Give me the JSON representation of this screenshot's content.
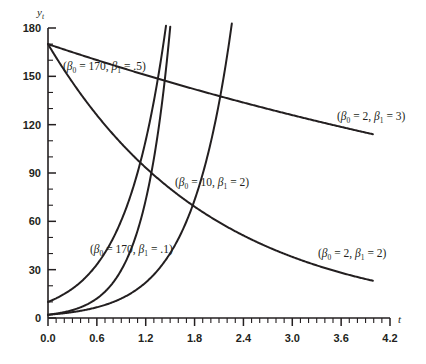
{
  "chart_data": {
    "type": "line",
    "title": "",
    "xlabel": "t",
    "ylabel": "y_t",
    "xlim": [
      0.0,
      4.2
    ],
    "ylim": [
      0,
      180
    ],
    "grid": false,
    "legend_position": "inline-annotations",
    "x_ticks": [
      "0.0",
      "0.6",
      "1.2",
      "1.8",
      "2.4",
      "3.0",
      "3.6",
      "4.2"
    ],
    "x_tick_values": [
      0.0,
      0.6,
      1.2,
      1.8,
      2.4,
      3.0,
      3.6,
      4.2
    ],
    "x_minor_step": 0.1,
    "y_ticks": [
      "0",
      "30",
      "60",
      "90",
      "120",
      "150",
      "180"
    ],
    "y_tick_values": [
      0,
      30,
      60,
      90,
      120,
      150,
      180
    ],
    "y_minor_step": 10,
    "model": "y_t = beta0 * exp(beta1 * t)",
    "series": [
      {
        "name": "(β₀ = 170, β₁ = .5)",
        "beta0": 170,
        "beta1": 0.5,
        "direction": "decay",
        "x": [
          0.0,
          0.2,
          0.4,
          0.6,
          0.8,
          1.0,
          1.2,
          1.4,
          1.6,
          1.8,
          2.0,
          2.2,
          2.4,
          2.6,
          2.8,
          3.0,
          3.2,
          3.4,
          3.6,
          3.8,
          4.0
        ],
        "values": [
          170.0,
          153.8,
          139.2,
          125.9,
          113.9,
          103.1,
          93.3,
          84.4,
          76.4,
          69.1,
          62.5,
          56.6,
          51.2,
          46.3,
          41.9,
          37.9,
          34.3,
          31.0,
          28.1,
          25.4,
          23.0
        ]
      },
      {
        "name": "(β₀ = 170, β₁ = .1)",
        "beta0": 170,
        "beta1": 0.1,
        "direction": "decay",
        "x": [
          0.0,
          0.1,
          0.2,
          0.3,
          0.4,
          0.5,
          0.6,
          0.7,
          0.8,
          0.9,
          1.0,
          1.2,
          1.4,
          1.6,
          1.8,
          2.0,
          2.4,
          2.8,
          3.2,
          3.6,
          4.0
        ],
        "values": [
          170.0,
          139.2,
          114.0,
          93.4,
          76.5,
          62.6,
          51.3,
          42.0,
          34.4,
          28.2,
          23.1,
          15.5,
          10.4,
          6.9,
          4.6,
          3.1,
          1.4,
          0.6,
          0.3,
          0.1,
          0.05
        ]
      },
      {
        "name": "(β₀ = 10, β₁ = 2)",
        "beta0": 10,
        "beta1": 2,
        "direction": "growth",
        "x": [
          0.0,
          0.2,
          0.4,
          0.6,
          0.8,
          1.0,
          1.2,
          1.4,
          1.6,
          1.8,
          2.0,
          2.2,
          2.4,
          2.6,
          2.8,
          3.0,
          3.2,
          3.4,
          3.6,
          3.8,
          4.0
        ],
        "values": [
          10.0,
          12.5,
          15.5,
          19.3,
          24.0,
          29.8,
          37.1,
          46.1,
          57.3,
          71.2,
          88.5,
          110.0,
          136.7,
          169.9,
          211.2,
          262.4,
          326.2,
          405.4,
          503.9,
          626.3,
          778.3
        ]
      },
      {
        "name": "(β₀ = 2, β₁ = 3)",
        "beta0": 2,
        "beta1": 3,
        "direction": "growth",
        "x": [
          0.0,
          0.2,
          0.4,
          0.6,
          0.8,
          1.0,
          1.2,
          1.4,
          1.6,
          1.8,
          2.0,
          2.2,
          2.4,
          2.6,
          2.8,
          3.0,
          3.2,
          3.4,
          3.6,
          3.8,
          4.0
        ],
        "values": [
          2.0,
          2.6,
          3.5,
          4.6,
          6.1,
          8.1,
          10.7,
          14.2,
          18.9,
          25.0,
          33.2,
          44.0,
          58.4,
          77.5,
          102.8,
          136.3,
          180.8,
          239.8,
          318.1,
          421.9,
          559.6
        ]
      },
      {
        "name": "(β₀ = 2, β₁ = 2)",
        "beta0": 2,
        "beta1": 2,
        "direction": "growth",
        "x": [
          0.0,
          0.4,
          0.8,
          1.2,
          1.6,
          2.0,
          2.4,
          2.8,
          3.2,
          3.6,
          4.0
        ],
        "values": [
          2.0,
          3.1,
          4.6,
          6.9,
          10.3,
          15.4,
          23.0,
          34.3,
          51.2,
          76.4,
          114.0
        ]
      }
    ],
    "annotations": [
      {
        "id": "ann-170-05",
        "text": "(β₀ = 170, β₁ = .5)",
        "beta0": "170",
        "beta1": ".5",
        "x_px": 63,
        "y_px": 70
      },
      {
        "id": "ann-2-3",
        "text": "(β₀ = 2, β₁ = 3)",
        "beta0": "2",
        "beta1": "3",
        "x_px": 337,
        "y_px": 120
      },
      {
        "id": "ann-10-2",
        "text": "(β₀ = 10, β₁ = 2)",
        "beta0": "10",
        "beta1": "2",
        "x_px": 175,
        "y_px": 186
      },
      {
        "id": "ann-170-01",
        "text": "(β₀ = 170, β₁ = .1)",
        "beta0": "170",
        "beta1": ".1",
        "x_px": 90,
        "y_px": 253
      },
      {
        "id": "ann-2-2",
        "text": "(β₀ = 2, β₁ = 2)",
        "beta0": "2",
        "beta1": "2",
        "x_px": 318,
        "y_px": 257
      }
    ],
    "colors": {
      "curve": "#231f20",
      "axis": "#231f20",
      "text": "#231f20",
      "background": "#ffffff"
    }
  },
  "axes": {
    "y_label": "y",
    "y_label_sub": "t",
    "x_label": "t"
  }
}
